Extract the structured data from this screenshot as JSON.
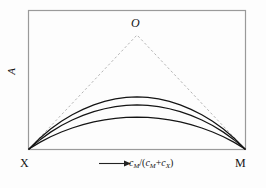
{
  "chart_data": {
    "type": "line",
    "title": "",
    "xlabel": "c_M/(c_M+c_X)",
    "ylabel": "A",
    "xlim": [
      0,
      1
    ],
    "ylim": [
      0,
      1
    ],
    "grid": false,
    "legend_position": "none",
    "axis_tick_labels": {
      "x": [],
      "y": []
    },
    "annotations": [
      {
        "name": "apex-vertex",
        "text": "O",
        "x": 0.5,
        "y": 1.0
      },
      {
        "name": "left-corner",
        "text": "X",
        "x": 0.0,
        "y": 0.0
      },
      {
        "name": "right-corner",
        "text": "M",
        "x": 1.0,
        "y": 0.0
      }
    ],
    "x": [
      0,
      0.05,
      0.1,
      0.15,
      0.2,
      0.25,
      0.3,
      0.35,
      0.4,
      0.45,
      0.5,
      0.55,
      0.6,
      0.65,
      0.7,
      0.75,
      0.8,
      0.85,
      0.9,
      0.95,
      1
    ],
    "series": [
      {
        "name": "dashed-ideal-upper",
        "style": "dashed",
        "values": [
          0,
          0.1,
          0.2,
          0.3,
          0.4,
          0.5,
          0.6,
          0.7,
          0.8,
          0.9,
          1.0,
          0.9,
          0.8,
          0.7,
          0.6,
          0.5,
          0.4,
          0.3,
          0.2,
          0.1,
          0
        ]
      },
      {
        "name": "curve-1-upper",
        "style": "solid",
        "values": [
          0,
          0.095,
          0.175,
          0.243,
          0.3,
          0.348,
          0.387,
          0.417,
          0.439,
          0.452,
          0.457,
          0.452,
          0.439,
          0.417,
          0.387,
          0.348,
          0.3,
          0.243,
          0.175,
          0.095,
          0
        ]
      },
      {
        "name": "curve-2-middle",
        "style": "solid",
        "values": [
          0,
          0.08,
          0.148,
          0.206,
          0.254,
          0.295,
          0.328,
          0.353,
          0.372,
          0.383,
          0.387,
          0.383,
          0.372,
          0.353,
          0.328,
          0.295,
          0.254,
          0.206,
          0.148,
          0.08,
          0
        ]
      },
      {
        "name": "curve-3-lower",
        "style": "solid",
        "values": [
          0,
          0.058,
          0.107,
          0.149,
          0.184,
          0.214,
          0.238,
          0.256,
          0.269,
          0.277,
          0.28,
          0.277,
          0.269,
          0.256,
          0.238,
          0.214,
          0.184,
          0.149,
          0.107,
          0.058,
          0
        ]
      }
    ]
  },
  "labels": {
    "apex": "O",
    "left_corner": "X",
    "right_corner": "M",
    "y_axis": "A",
    "x_axis_numer_c": "c",
    "x_axis_numer_sub": "M",
    "x_axis_slash": "/(",
    "x_axis_den1_c": "c",
    "x_axis_den1_sub": "M",
    "x_axis_plus": "+",
    "x_axis_den2_c": "c",
    "x_axis_den2_sub": "X",
    "x_axis_close": ")"
  },
  "colors": {
    "frame": "#9a9a9a",
    "curve": "#141414",
    "dashed": "#b0b0b0",
    "text": "#141414",
    "background": "#fdfdfd"
  }
}
